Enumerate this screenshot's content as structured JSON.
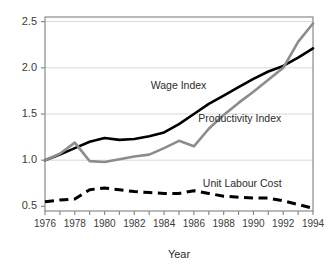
{
  "chart_data": {
    "type": "line",
    "title": "",
    "xlabel": "Year",
    "ylabel": "",
    "xlim": [
      1976,
      1994
    ],
    "ylim": [
      0.45,
      2.55
    ],
    "grid": true,
    "grid_axis": "y",
    "legend": "inline-annotations",
    "x": [
      1976,
      1977,
      1978,
      1979,
      1980,
      1981,
      1982,
      1983,
      1984,
      1985,
      1986,
      1987,
      1988,
      1989,
      1990,
      1991,
      1992,
      1993,
      1994
    ],
    "xticks": [
      1976,
      1977,
      1978,
      1979,
      1980,
      1981,
      1982,
      1983,
      1984,
      1985,
      1986,
      1987,
      1988,
      1989,
      1990,
      1991,
      1992,
      1993,
      1994
    ],
    "xtick_labels": [
      "1976",
      "",
      "1978",
      "",
      "1980",
      "",
      "1982",
      "",
      "1984",
      "",
      "1986",
      "",
      "1988",
      "",
      "1990",
      "",
      "1992",
      "",
      "1994"
    ],
    "yticks": [
      0.5,
      1.0,
      1.5,
      2.0,
      2.5
    ],
    "ytick_labels": [
      "0.5",
      "1.0",
      "1.5",
      "2.0",
      "2.5"
    ],
    "series": [
      {
        "name": "Wage Index",
        "color": "#000000",
        "style": "solid",
        "width": 2.6,
        "label_x": 1983.1,
        "label_y": 1.8,
        "values": [
          1.0,
          1.06,
          1.13,
          1.2,
          1.24,
          1.22,
          1.23,
          1.26,
          1.3,
          1.39,
          1.5,
          1.61,
          1.7,
          1.79,
          1.88,
          1.96,
          2.02,
          2.11,
          2.21
        ]
      },
      {
        "name": "Productivity Index",
        "color": "#8c8c8c",
        "style": "solid",
        "width": 2.6,
        "label_x": 1986.3,
        "label_y": 1.44,
        "values": [
          1.0,
          1.07,
          1.19,
          0.99,
          0.98,
          1.01,
          1.04,
          1.06,
          1.13,
          1.21,
          1.15,
          1.34,
          1.49,
          1.62,
          1.74,
          1.87,
          2.0,
          2.28,
          2.48
        ]
      },
      {
        "name": "Unit Labour Cost",
        "color": "#000000",
        "style": "dashed",
        "width": 3.0,
        "label_x": 1986.6,
        "label_y": 0.745,
        "values": [
          0.55,
          0.57,
          0.58,
          0.68,
          0.7,
          0.68,
          0.66,
          0.65,
          0.64,
          0.64,
          0.67,
          0.64,
          0.61,
          0.6,
          0.59,
          0.59,
          0.56,
          0.52,
          0.48
        ]
      }
    ]
  },
  "axes": {
    "xlabel": "Year"
  },
  "colors": {
    "frame": "#8a8a8a",
    "grid": "#d9d9d9",
    "tick_text": "#3b3b3b",
    "wage": "#000000",
    "productivity": "#8c8c8c",
    "ulc": "#000000",
    "background": "#ffffff"
  }
}
